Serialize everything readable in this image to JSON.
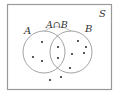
{
  "diagram": {
    "type": "venn",
    "universe_label": "S",
    "set_a_label": "A",
    "set_b_label": "B",
    "intersection_label": "A∩B",
    "colors": {
      "stroke": "#888888",
      "dot": "#333333",
      "text": "#333333"
    },
    "regions": {
      "a_only": {
        "count": 3,
        "points": [
          [
            42,
            42
          ],
          [
            33,
            57
          ],
          [
            42,
            61
          ]
        ]
      },
      "a_and_b": {
        "count": 2,
        "points": [
          [
            58,
            47
          ],
          [
            58,
            58
          ]
        ]
      },
      "b_only": {
        "count": 5,
        "points": [
          [
            78,
            41
          ],
          [
            86,
            47
          ],
          [
            72,
            54
          ],
          [
            84,
            53
          ],
          [
            70,
            68
          ]
        ]
      },
      "outside": {
        "count": 2,
        "points": [
          [
            50,
            80
          ],
          [
            61,
            77
          ]
        ]
      }
    }
  }
}
